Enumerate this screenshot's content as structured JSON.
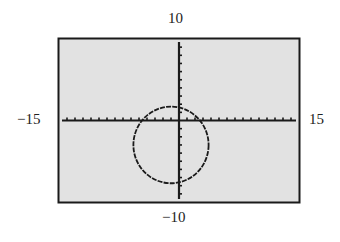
{
  "window": {
    "xmin": "-15",
    "xmax": "15",
    "ymin": "-10",
    "ymax": "10"
  },
  "colors": {
    "screen_bg": "#e2e2e2",
    "frame": "#1a1a1a",
    "axes": "#1a1a1a",
    "curve": "#1a1a1a"
  },
  "chart_data": {
    "type": "line",
    "title": "",
    "xlabel": "",
    "ylabel": "",
    "xlim": [
      -15,
      15
    ],
    "ylim": [
      -10,
      10
    ],
    "x_tick_spacing": 1,
    "y_tick_spacing": 1,
    "grid": false,
    "legend": null,
    "tick_labels": {
      "left": "-15",
      "right": "15",
      "top": "10",
      "bottom": "-10"
    },
    "series": [
      {
        "name": "circle",
        "shape": "circle",
        "center": [
          -1,
          -3
        ],
        "radius": 4.7
      }
    ]
  }
}
